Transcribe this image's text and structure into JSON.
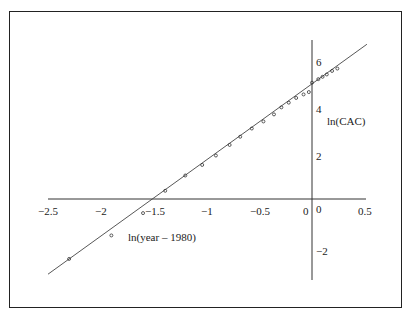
{
  "chart_data": {
    "type": "scatter",
    "title": "",
    "xlabel": "ln(year – 1980)",
    "ylabel": "ln(CAC)",
    "xlim": [
      -2.5,
      0.5
    ],
    "ylim": [
      -3.4,
      6.8
    ],
    "x_ticks": [
      "-2.5",
      "-2",
      "-1.5",
      "-1",
      "-0.5",
      "0",
      "0.5"
    ],
    "y_ticks": [
      "6",
      "4",
      "2",
      "0",
      "-2"
    ],
    "grid": false,
    "legend": null,
    "fit_line": {
      "intercept": 4.9,
      "slope": 3.24,
      "x_range": [
        -2.5,
        0.5
      ]
    },
    "series": [
      {
        "name": "observed",
        "marker": "open-circle",
        "x": [
          -2.3,
          -1.9,
          -1.6,
          -1.39,
          -1.2,
          -1.04,
          -0.91,
          -0.78,
          -0.68,
          -0.57,
          -0.46,
          -0.36,
          -0.29,
          -0.22,
          -0.15,
          -0.08,
          -0.03,
          0.0,
          0.06,
          0.1,
          0.14,
          0.19,
          0.24
        ],
        "y": [
          -2.55,
          -1.55,
          -0.6,
          0.35,
          1.0,
          1.45,
          1.85,
          2.3,
          2.65,
          3.0,
          3.3,
          3.6,
          3.9,
          4.1,
          4.3,
          4.45,
          4.55,
          4.95,
          5.1,
          5.2,
          5.3,
          5.45,
          5.55
        ]
      }
    ]
  },
  "labels": {
    "xlabel": "ln(year – 1980)",
    "ylabel": "ln(CAC)",
    "x_ticks": [
      "−2.5",
      "−2",
      "−1.5",
      "−1",
      "−0.5",
      "0",
      "0.5"
    ],
    "y_ticks": [
      "6",
      "4",
      "2",
      "0",
      "−2"
    ]
  }
}
